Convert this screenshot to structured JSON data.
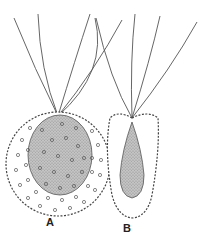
{
  "figure": {
    "type": "biological illustration",
    "colors": {
      "background": "#ffffff",
      "ink": "#444444",
      "nucleus_fill": "#bdbdbd",
      "stipple_fill": "#a8a8a8"
    },
    "panels": [
      {
        "id": "A",
        "label": "A",
        "description": "Round cell with flagella tuft; large stippled nucleus; surface covered with small circular granules"
      },
      {
        "id": "B",
        "label": "B",
        "description": "Elongated teardrop cell with flagella tuft; stippled teardrop-shaped inner body; outline beaded"
      }
    ]
  }
}
